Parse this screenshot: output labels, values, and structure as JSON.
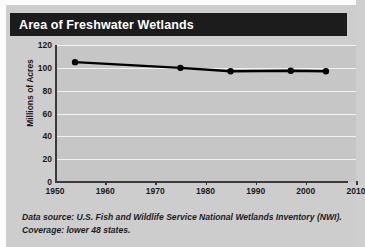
{
  "title": "Area of Freshwater Wetlands",
  "footnote_line1": "Data source: U.S. Fish and Wildlife Service National Wetlands Inventory",
  "footnote_line2": "(NWI). Coverage: lower 48 states.",
  "colors": {
    "banner_bg": "#1c1c1c",
    "banner_text": "#ffffff",
    "page_bg": "#cdcdcd",
    "plot_bg": "#c6c6c6",
    "gridline": "#f2f2f2",
    "axis": "#3a3a3a",
    "series": "#000000"
  },
  "chart_data": {
    "type": "line",
    "title": "Area of Freshwater Wetlands",
    "xlabel": "",
    "ylabel": "Millions of Acres",
    "xlim": [
      1950,
      2010
    ],
    "ylim": [
      0,
      120
    ],
    "grid": true,
    "legend": "none",
    "x_ticks": [
      1950,
      1960,
      1970,
      1980,
      1990,
      2000,
      2010
    ],
    "x_tick_labels": [
      "1950",
      "1960",
      "1970",
      "1980",
      "1990",
      "2000",
      "2010"
    ],
    "y_ticks": [
      0,
      20,
      40,
      60,
      80,
      100,
      120
    ],
    "y_tick_labels": [
      "0",
      "20",
      "40",
      "60",
      "80",
      "100",
      "120"
    ],
    "series": [
      {
        "name": "Freshwater wetlands area",
        "marker": "circle",
        "x": [
          1954,
          1975,
          1985,
          1997,
          2004
        ],
        "values": [
          105,
          100,
          97,
          97.5,
          97
        ]
      }
    ]
  }
}
